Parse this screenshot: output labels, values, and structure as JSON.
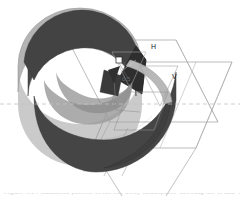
{
  "figure": {
    "background_color": "#ffffff",
    "palette": {
      "shell_outer": "#b4b4b4",
      "shell_inner_dark": "#3f3f3f",
      "shell_inner_mid": "#565656",
      "shell_cut_face": "#8e8e8e",
      "shell_rim": "#9a9a9a",
      "plane_stroke": "#9a9a9a",
      "mesh_stroke": "#6e6e6e",
      "axis_dash": "#bdbdbd",
      "marker_fill": "#ffffff",
      "marker_stroke": "#2a2a2a",
      "caption_text": "#cfcfcf"
    },
    "labels": {
      "h_plane": "H",
      "v_plane": "V",
      "center_annotation": "0.5",
      "origin_marker": "■"
    },
    "axis": {
      "dashed_horizontal": true,
      "dash_pattern": "4 3",
      "y_position": 104
    },
    "caption": "Figure 3.14  Radiation pattern of the cut-away hemisphere showing the H and V planes."
  }
}
